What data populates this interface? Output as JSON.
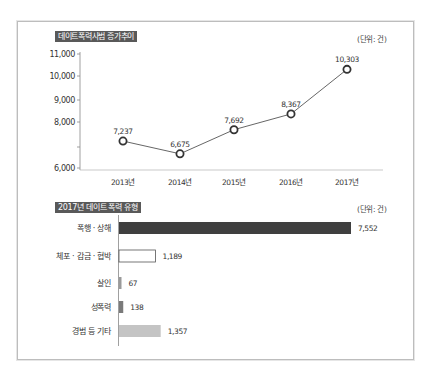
{
  "line_section": {
    "title": "데이트폭력사범 증가추이",
    "unit": "(단위: 건)"
  },
  "bar_section": {
    "title": "2017년 데이트 폭력 유형",
    "unit": "(단위: 건)"
  },
  "colors": {
    "title_bg": "#595959",
    "line": "#555555",
    "bar_dark": "#3f3f3f",
    "bar_white": "#ffffff",
    "bar_gray": "#8c8c8c",
    "bar_light": "#c4c4c4",
    "frame": "#bdbdbd"
  },
  "chart_data": [
    {
      "type": "line",
      "title": "데이트폭력사범 증가추이",
      "unit": "(단위: 건)",
      "x": [
        "2013년",
        "2014년",
        "2015년",
        "2016년",
        "2017년"
      ],
      "series": [
        {
          "name": "데이트폭력사범",
          "values": [
            7237,
            6675,
            7692,
            8367,
            10303
          ],
          "labels": [
            "7,237",
            "6,675",
            "7,692",
            "8,367",
            "10,303"
          ]
        }
      ],
      "yticks": [
        {
          "value": 11000,
          "label": "11,000"
        },
        {
          "value": 10000,
          "label": "10,000"
        },
        {
          "value": 9000,
          "label": "9,000"
        },
        {
          "value": 8000,
          "label": "8,000"
        },
        {
          "value": 7000,
          "label": ""
        },
        {
          "value": 6000,
          "label": "6,000"
        }
      ],
      "ylim": [
        6000,
        11000
      ],
      "xlabel": "",
      "ylabel": "",
      "grid": false,
      "marker": "hollow-circle"
    },
    {
      "type": "bar",
      "orientation": "horizontal",
      "title": "2017년 데이트 폭력 유형",
      "unit": "(단위: 건)",
      "categories": [
        "폭행 · 상해",
        "체포 · 감금 · 협박",
        "살인",
        "성폭력",
        "경범 등 기타"
      ],
      "values": [
        7552,
        1189,
        67,
        138,
        1357
      ],
      "labels": [
        "7,552",
        "1,189",
        "67",
        "138",
        "1,357"
      ],
      "bar_colors": [
        "#3f3f3f",
        "#ffffff",
        "#9a9a9a",
        "#7a7a7a",
        "#c4c4c4"
      ],
      "grid": false
    }
  ]
}
